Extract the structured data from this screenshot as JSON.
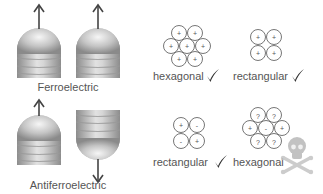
{
  "colors": {
    "text": "#555555",
    "circle_stroke": "#666666",
    "arrow": "#444444",
    "check": "#333333",
    "pillar_dark": "#8a8a8a",
    "pillar_light": "#f2f2f2",
    "skull": "#c8c8c8"
  },
  "ferroelectric": {
    "label": "Ferroelectric",
    "pillars": [
      {
        "orientation": "up",
        "arrow": "up"
      },
      {
        "orientation": "up",
        "arrow": "up"
      }
    ],
    "lattices": [
      {
        "name": "hexagonal",
        "label": "hexagonal",
        "verdict": "check",
        "charges": [
          "+",
          "+",
          "+",
          "+",
          "+",
          "+",
          "+"
        ]
      },
      {
        "name": "rectangular",
        "label": "rectangular",
        "verdict": "check",
        "charges": [
          "+",
          "+",
          "+",
          "+"
        ]
      }
    ]
  },
  "antiferroelectric": {
    "label": "Antiferroelectric",
    "pillars": [
      {
        "orientation": "up",
        "arrow": "up"
      },
      {
        "orientation": "down",
        "arrow": "down"
      }
    ],
    "lattices": [
      {
        "name": "rectangular",
        "label": "rectangular",
        "verdict": "check",
        "charges": [
          "+",
          "-",
          "-",
          "+"
        ]
      },
      {
        "name": "hexagonal",
        "label": "hexagonal",
        "verdict": "skull-and-crossbones",
        "charges": [
          "?",
          "?",
          "+",
          "-",
          "+",
          "?",
          "?"
        ]
      }
    ]
  },
  "icons": {
    "check": "check-mark-icon",
    "fail": "skull-crossbones-icon",
    "polarization": "arrow-icon"
  }
}
